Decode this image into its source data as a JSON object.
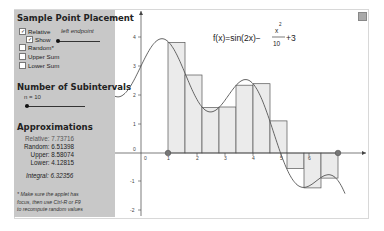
{
  "panel": {
    "sample_title": "Sample Point Placement",
    "checkboxes": [
      {
        "label": "Relative",
        "checked": true
      },
      {
        "label": "Show",
        "checked": true
      },
      {
        "label": "Random*",
        "checked": false
      },
      {
        "label": "Upper Sum",
        "checked": false
      },
      {
        "label": "Lower Sum",
        "checked": false
      }
    ],
    "placement_value": "left endpoint",
    "subintervals_title": "Number of Subintervals",
    "n_label": "n = 10",
    "approx_title": "Approximations",
    "approximations": [
      {
        "label": "Relative:",
        "value": "7.73716"
      },
      {
        "label": "Random:",
        "value": "6.51398"
      },
      {
        "label": "Upper:",
        "value": "8.58074"
      },
      {
        "label": "Lower:",
        "value": "4.12815"
      }
    ],
    "integral_label": "Integral:",
    "integral_value": "6.32356",
    "note_lines": [
      "* Make sure the applet has",
      "focus, then use Ctrl-R or F9",
      "to recompute random values"
    ]
  },
  "graph": {
    "formula_lhs": "f(x)=sin(2x)−",
    "formula_num": "x",
    "formula_exp": "2",
    "formula_den": "10",
    "formula_tail": "+3",
    "x_ticks": [
      "0",
      "1",
      "2",
      "3",
      "4",
      "5",
      "6"
    ],
    "y_ticks": [
      "4",
      "3",
      "2",
      "1",
      "0",
      "-1",
      "-2"
    ],
    "settings_icon": "settings-icon"
  },
  "chart_data": {
    "type": "line",
    "function": "sin(2x) - x^2/10 + 3",
    "interval": [
      1,
      7
    ],
    "n": 10,
    "sample": "left endpoint",
    "rect_left_x": [
      1.0,
      1.6,
      2.2,
      2.8,
      3.4,
      4.0,
      4.6,
      5.2,
      5.8,
      6.4
    ],
    "rect_heights": [
      3.81,
      2.69,
      1.57,
      1.59,
      2.34,
      2.39,
      1.11,
      -0.53,
      -1.2,
      -0.87
    ],
    "xlim": [
      -1,
      8.5
    ],
    "ylim": [
      -2,
      4.5
    ],
    "grid": false
  }
}
